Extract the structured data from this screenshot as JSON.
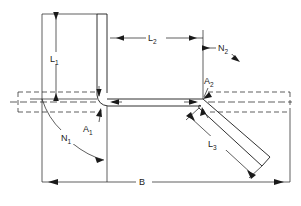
{
  "diagram": {
    "type": "engineering-dimension-drawing",
    "background_color": "#ffffff",
    "line_color": "#1a1a1a",
    "labels": {
      "length_vertical": {
        "base": "L",
        "sub": "1",
        "text": "L1"
      },
      "length_horizontal": {
        "base": "L",
        "sub": "2",
        "text": "L2"
      },
      "length_inclined": {
        "base": "L",
        "sub": "3",
        "text": "L3"
      },
      "angle_left": {
        "base": "N",
        "sub": "1",
        "text": "N1"
      },
      "angle_right": {
        "base": "N",
        "sub": "2",
        "text": "N2"
      },
      "node_left": {
        "base": "A",
        "sub": "1",
        "text": "A1"
      },
      "node_right": {
        "base": "A",
        "sub": "2",
        "text": "A2"
      },
      "overall_width": {
        "base": "B",
        "sub": "",
        "text": "B"
      }
    },
    "dimensions": [
      {
        "name": "L1",
        "kind": "linear",
        "orientation": "vertical",
        "label": "L1"
      },
      {
        "name": "L2",
        "kind": "linear",
        "orientation": "horizontal",
        "label": "L2"
      },
      {
        "name": "L3",
        "kind": "linear",
        "orientation": "inclined",
        "label": "L3"
      },
      {
        "name": "B",
        "kind": "linear",
        "orientation": "horizontal",
        "label": "B"
      },
      {
        "name": "N1",
        "kind": "angular",
        "label": "N1"
      },
      {
        "name": "N2",
        "kind": "angular",
        "label": "N2"
      }
    ],
    "nodes": [
      {
        "name": "A1",
        "label": "A1",
        "description": "junction of vertical leg with horizontal run"
      },
      {
        "name": "A2",
        "label": "A2",
        "description": "junction of horizontal run with inclined leg"
      }
    ]
  }
}
